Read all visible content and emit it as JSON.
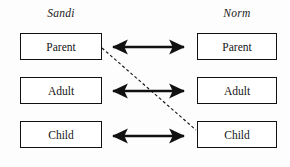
{
  "diagram": {
    "type": "transactional-analysis-ego-state-diagram",
    "background_color": "#fdfdfd",
    "line_color": "#111111",
    "columns": [
      {
        "id": "left",
        "header": "Sandi",
        "states": [
          {
            "id": "parent",
            "label": "Parent"
          },
          {
            "id": "adult",
            "label": "Adult"
          },
          {
            "id": "child",
            "label": "Child"
          }
        ]
      },
      {
        "id": "right",
        "header": "Norm",
        "states": [
          {
            "id": "parent",
            "label": "Parent"
          },
          {
            "id": "adult",
            "label": "Adult"
          },
          {
            "id": "child",
            "label": "Child"
          }
        ]
      }
    ],
    "connectors": [
      {
        "id": "parent-parent",
        "style": "solid",
        "heads": "double",
        "from": "left.parent",
        "to": "right.parent"
      },
      {
        "id": "adult-adult",
        "style": "solid",
        "heads": "double",
        "from": "left.adult",
        "to": "right.adult"
      },
      {
        "id": "child-child",
        "style": "solid",
        "heads": "double",
        "from": "left.child",
        "to": "right.child"
      },
      {
        "id": "parent-child-crossed",
        "style": "dashed",
        "heads": "none",
        "from": "left.parent",
        "to": "right.child"
      }
    ]
  }
}
